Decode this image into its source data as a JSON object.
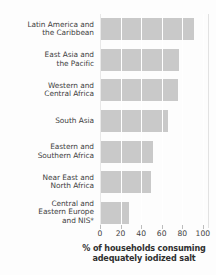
{
  "chart_data": {
    "type": "bar",
    "orientation": "horizontal",
    "title": "",
    "subtitle": "",
    "xlabel": "% of households consuming adequately iodized salt",
    "xlabel_line1": "% of households consuming",
    "xlabel_line2": "adequately iodized salt",
    "ylabel": "",
    "categories": [
      "Latin America and the Caribbean",
      "East Asia and the Pacific",
      "Western and Central Africa",
      "South Asia",
      "Eastern and Southern Africa",
      "Near East and North Africa",
      "Central and Eastern Europe and NIS*"
    ],
    "category_lines": [
      [
        "Latin America and",
        "the Caribbean"
      ],
      [
        "East Asia and",
        "the Pacific"
      ],
      [
        "Western and",
        "Central Africa"
      ],
      [
        "South Asia"
      ],
      [
        "Eastern and",
        "Southern Africa"
      ],
      [
        "Near East and",
        "North Africa"
      ],
      [
        "Central and",
        "Eastern Europe",
        "and NIS*"
      ]
    ],
    "values": [
      91,
      77,
      76,
      66,
      52,
      50,
      28
    ],
    "xlim": [
      0,
      105
    ],
    "xticks": [
      0,
      20,
      40,
      60,
      80,
      100
    ],
    "xtick_labels": [
      "0",
      "20",
      "40",
      "60",
      "80",
      "100"
    ],
    "grid": true,
    "grid_axis": "x",
    "legend": null,
    "bar_color": "#c9c9c9",
    "gridline_color": "#ffffff",
    "text_color": "#3f3f3f",
    "background_color": "#fdfdfd",
    "footnote_marker": "*"
  }
}
